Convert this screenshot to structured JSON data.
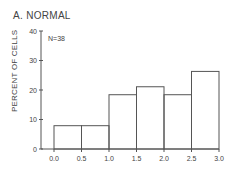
{
  "chart_data": {
    "type": "bar",
    "title": "A. NORMAL",
    "annotation": "N=38",
    "xlabel": "",
    "ylabel": "PERCENT OF CELLS",
    "bins": [
      [
        0.0,
        0.5
      ],
      [
        0.5,
        1.0
      ],
      [
        1.0,
        1.5
      ],
      [
        1.5,
        2.0
      ],
      [
        2.0,
        2.5
      ],
      [
        2.5,
        3.0
      ]
    ],
    "categories": [
      "0.0-0.5",
      "0.5-1.0",
      "1.0-1.5",
      "1.5-2.0",
      "2.0-2.5",
      "2.5-3.0"
    ],
    "values": [
      7.9,
      7.9,
      18.4,
      21.1,
      18.4,
      26.3
    ],
    "counts": [
      3,
      3,
      7,
      8,
      7,
      10
    ],
    "x_ticks": [
      "0.0",
      "0.5",
      "1.0",
      "1.5",
      "2.0",
      "2.5",
      "3.0"
    ],
    "y_ticks": [
      "0",
      "10",
      "20",
      "30",
      "40"
    ],
    "ylim": [
      0,
      40
    ],
    "xlim": [
      0.0,
      3.0
    ],
    "grid": false,
    "legend": null
  },
  "labels": {
    "title": "A. NORMAL",
    "n": "N=38",
    "ylabel": "PERCENT OF CELLS"
  }
}
